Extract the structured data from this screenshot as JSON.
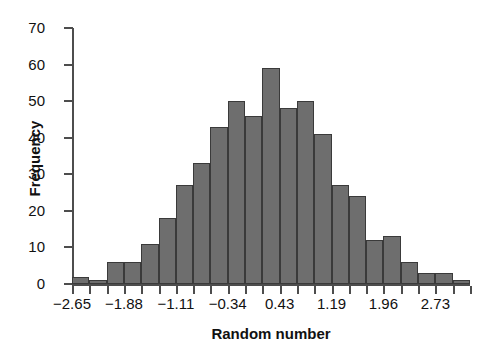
{
  "chart_data": {
    "type": "bar",
    "title": "",
    "xlabel": "Random number",
    "ylabel": "Frequency",
    "ylim": [
      0,
      70
    ],
    "y_ticks": [
      0,
      10,
      20,
      30,
      40,
      50,
      60,
      70
    ],
    "x_tick_labels": [
      "−2.65",
      "−1.88",
      "−1.11",
      "−0.34",
      "0.43",
      "1.19",
      "1.96",
      "2.73"
    ],
    "x_tick_values": [
      -2.65,
      -1.88,
      -1.11,
      -0.34,
      0.43,
      1.19,
      1.96,
      2.73
    ],
    "bin_width": 0.2567,
    "categories": [
      "−2.65",
      "−2.39",
      "−2.14",
      "−1.88",
      "−1.62",
      "−1.37",
      "−1.11",
      "−0.85",
      "−0.60",
      "−0.34",
      "−0.08",
      "0.17",
      "0.43",
      "0.68",
      "0.94",
      "1.19",
      "1.45",
      "1.71",
      "1.96",
      "2.22",
      "2.47",
      "2.73",
      "2.99"
    ],
    "values": [
      2,
      1,
      6,
      6,
      11,
      18,
      27,
      33,
      43,
      50,
      46,
      59,
      48,
      50,
      41,
      27,
      24,
      12,
      13,
      6,
      3,
      3,
      1
    ],
    "grid": false,
    "legend": "none",
    "bar_color": "#6e6e6e",
    "bar_border_color": "#3a3a3a",
    "axis_color": "#4d4d4d",
    "text_color": "#111111"
  }
}
